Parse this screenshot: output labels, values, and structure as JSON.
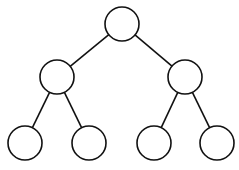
{
  "diagram": {
    "type": "binary-tree",
    "levels": 3,
    "node_radius": 17,
    "stroke_color": "#111111",
    "fill_color": "#ffffff",
    "nodes": [
      {
        "id": "root",
        "cx": 122,
        "cy": 24,
        "label": ""
      },
      {
        "id": "left",
        "cx": 57,
        "cy": 77,
        "label": ""
      },
      {
        "id": "right",
        "cx": 185,
        "cy": 77,
        "label": ""
      },
      {
        "id": "left-left",
        "cx": 25,
        "cy": 143,
        "label": ""
      },
      {
        "id": "left-right",
        "cx": 89,
        "cy": 143,
        "label": ""
      },
      {
        "id": "right-left",
        "cx": 154,
        "cy": 143,
        "label": ""
      },
      {
        "id": "right-right",
        "cx": 217,
        "cy": 143,
        "label": ""
      }
    ],
    "edges": [
      {
        "from": "root",
        "to": "left"
      },
      {
        "from": "root",
        "to": "right"
      },
      {
        "from": "left",
        "to": "left-left"
      },
      {
        "from": "left",
        "to": "left-right"
      },
      {
        "from": "right",
        "to": "right-left"
      },
      {
        "from": "right",
        "to": "right-right"
      }
    ]
  }
}
